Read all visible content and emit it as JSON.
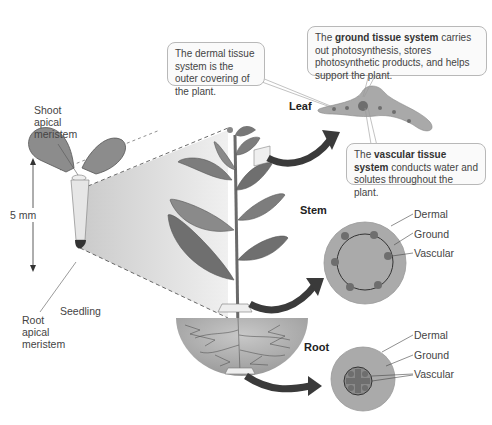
{
  "seedling": {
    "shoot_label": [
      "Shoot",
      "apical",
      "meristem"
    ],
    "root_label": [
      "Root",
      "apical",
      "meristem"
    ],
    "seedling_label": "Seedling",
    "scale_label": "5 mm"
  },
  "organs": {
    "leaf": "Leaf",
    "stem": "Stem",
    "root": "Root"
  },
  "callouts": {
    "dermal": {
      "text": "The dermal tissue system is the outer covering of the plant."
    },
    "ground": {
      "prefix": "The ",
      "bold": "ground tissue system",
      "suffix": " carries out photosynthesis, stores photosynthetic products, and helps support the plant."
    },
    "vascular": {
      "prefix": "The ",
      "bold": "vascular tissue system",
      "suffix": " conducts water and solutes throughout the plant."
    }
  },
  "stem_labels": [
    "Dermal",
    "Ground",
    "Vascular"
  ],
  "root_labels": [
    "Dermal",
    "Ground",
    "Vascular"
  ],
  "colors": {
    "tissue_fill": "#a9a9a9",
    "tissue_dark": "#6e6e6e",
    "arrow": "#3a3a3a",
    "projection": "#d8d8d8"
  }
}
